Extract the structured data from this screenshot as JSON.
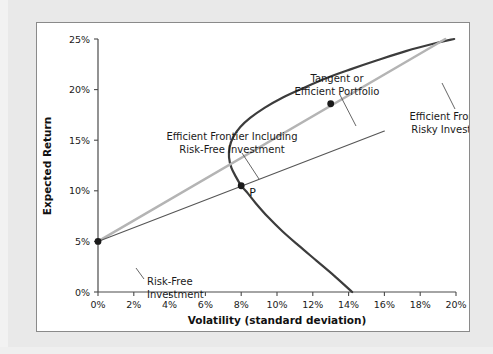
{
  "figure": {
    "background_color": "#e9e9e9",
    "panel_color": "#ffffff",
    "border_color": "#8a8a8a"
  },
  "chart_data": {
    "type": "line",
    "title": "",
    "xlabel": "Volatility (standard deviation)",
    "ylabel": "Expected Return",
    "xlim": [
      0,
      20
    ],
    "ylim": [
      0,
      25
    ],
    "grid": false,
    "legend": "none",
    "x_tick_labels": [
      "0%",
      "2%",
      "4%",
      "6%",
      "8%",
      "10%",
      "12%",
      "14%",
      "16%",
      "18%",
      "20%"
    ],
    "x_tick_values": [
      0,
      2,
      4,
      6,
      8,
      10,
      12,
      14,
      16,
      18,
      20
    ],
    "y_tick_labels": [
      "0%",
      "5%",
      "10%",
      "15%",
      "20%",
      "25%"
    ],
    "y_tick_values": [
      0,
      5,
      10,
      15,
      20,
      25
    ],
    "series": [
      {
        "name": "Efficient Frontier of Risky Investments",
        "style": "curve",
        "color": "#3c3c3c",
        "width": 2.2,
        "comment": "hyperbolic minimum-variance frontier; upper branch is the efficient frontier",
        "points": [
          [
            14.2,
            0.0
          ],
          [
            13.2,
            1.6
          ],
          [
            12.2,
            3.1
          ],
          [
            11.2,
            4.6
          ],
          [
            10.3,
            6.0
          ],
          [
            9.5,
            7.4
          ],
          [
            8.8,
            8.8
          ],
          [
            8.3,
            9.9
          ],
          [
            8.0,
            10.5
          ],
          [
            7.7,
            11.4
          ],
          [
            7.45,
            12.3
          ],
          [
            7.32,
            13.3
          ],
          [
            7.35,
            14.3
          ],
          [
            7.55,
            15.3
          ],
          [
            7.95,
            16.3
          ],
          [
            8.5,
            17.2
          ],
          [
            9.3,
            18.2
          ],
          [
            10.3,
            19.2
          ],
          [
            11.4,
            20.1
          ],
          [
            12.7,
            21.1
          ],
          [
            14.1,
            22.0
          ],
          [
            15.6,
            22.9
          ],
          [
            17.2,
            23.8
          ],
          [
            18.9,
            24.6
          ],
          [
            19.9,
            25.0
          ]
        ]
      },
      {
        "name": "Efficient Frontier Including Risk-Free Investment",
        "style": "tangent-line",
        "color": "#b4b4b4",
        "width": 2.4,
        "comment": "capital market line from risk-free rate through tangent portfolio",
        "points": [
          [
            0.0,
            5.0
          ],
          [
            19.4,
            25.0
          ]
        ]
      },
      {
        "name": "Line through P",
        "style": "thin-line",
        "color": "#555555",
        "width": 1.1,
        "comment": "inefficient capital allocation line through risk-free asset and portfolio P",
        "points": [
          [
            0.0,
            5.0
          ],
          [
            16.0,
            15.9
          ]
        ]
      }
    ],
    "markers": [
      {
        "name": "risk-free-investment-point",
        "x": 0.0,
        "y": 5.0,
        "label": "Risk-Free Investment",
        "color": "#1a1a1a",
        "radius": 3.4
      },
      {
        "name": "tangent-portfolio-point",
        "x": 13.0,
        "y": 18.6,
        "label": "Tangent or Efficient Portfolio",
        "color": "#1a1a1a",
        "radius": 3.4
      },
      {
        "name": "portfolio-p-point",
        "x": 8.0,
        "y": 10.5,
        "label": "P",
        "color": "#1a1a1a",
        "radius": 3.4
      }
    ],
    "annotations": [
      {
        "name": "annotation-efficient-frontier-including-risk-free",
        "line1": "Efficient Frontier Including",
        "line2": "Risk-Free Investment",
        "anchor": "middle",
        "text_x": 195,
        "text_y": 117,
        "leader": [
          [
            205,
            130
          ],
          [
            222,
            156
          ]
        ]
      },
      {
        "name": "annotation-tangent-or-efficient-portfolio",
        "line1": "Tangent or",
        "line2": "Efficient Portfolio",
        "anchor": "middle",
        "text_x": 300,
        "text_y": 59,
        "leader": [
          [
            303,
            72
          ],
          [
            319,
            103
          ]
        ]
      },
      {
        "name": "annotation-efficient-frontier-of-risky",
        "line1": "Efficient Frontier of",
        "line2": "Risky Investments",
        "anchor": "middle",
        "text_x": 420,
        "text_y": 97,
        "leader": [
          [
            418,
            86
          ],
          [
            405,
            60
          ]
        ]
      },
      {
        "name": "annotation-risk-free-investment",
        "line1": "Risk-Free",
        "line2": "Investment",
        "anchor": "start",
        "text_x": 110,
        "text_y": 262,
        "leader": [
          [
            107,
            256
          ],
          [
            99,
            245
          ]
        ]
      }
    ],
    "point_label": "P"
  }
}
